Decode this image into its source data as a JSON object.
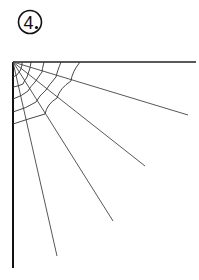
{
  "label": {
    "number": "4",
    "suffix": "."
  },
  "figure": {
    "stroke_color": "#333333",
    "frame_color": "#111111"
  }
}
